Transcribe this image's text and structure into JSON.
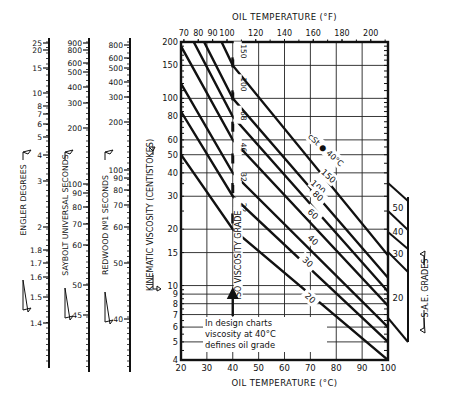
{
  "chart_data": {
    "type": "line",
    "x_bottom": {
      "label": "OIL TEMPERATURE (°C)",
      "ticks": [
        20,
        30,
        40,
        50,
        60,
        70,
        80,
        90,
        100
      ],
      "range": [
        20,
        100
      ]
    },
    "x_top": {
      "label": "OIL TEMPERATURE (°F)",
      "ticks": [
        70,
        80,
        90,
        100,
        120,
        140,
        160,
        180,
        200
      ]
    },
    "y": {
      "label": "KINEMATIC VISCOSITY (CENTISTOKES)",
      "scale": "log",
      "range": [
        4,
        200
      ],
      "ticks": [
        4,
        5,
        6,
        7,
        8,
        9,
        10,
        15,
        20,
        30,
        40,
        50,
        60,
        80,
        100,
        150,
        200
      ]
    },
    "grid": true,
    "series_label": "cSt @ 40°C",
    "series": [
      {
        "name": "150",
        "points": [
          [
            20,
            570
          ],
          [
            40,
            150
          ],
          [
            100,
            14.5
          ]
        ]
      },
      {
        "name": "100",
        "points": [
          [
            20,
            350
          ],
          [
            40,
            100
          ],
          [
            100,
            11.0
          ]
        ]
      },
      {
        "name": "80",
        "points": [
          [
            20,
            270
          ],
          [
            40,
            80
          ],
          [
            100,
            9.3
          ]
        ]
      },
      {
        "name": "60",
        "points": [
          [
            20,
            190
          ],
          [
            40,
            60
          ],
          [
            100,
            7.8
          ]
        ]
      },
      {
        "name": "40",
        "points": [
          [
            20,
            120
          ],
          [
            40,
            40
          ],
          [
            100,
            6.0
          ]
        ]
      },
      {
        "name": "30",
        "points": [
          [
            20,
            85
          ],
          [
            40,
            30
          ],
          [
            100,
            5.0
          ]
        ]
      },
      {
        "name": "20",
        "points": [
          [
            20,
            50
          ],
          [
            40,
            20
          ],
          [
            100,
            4.0
          ]
        ]
      }
    ],
    "iso_vg_grades_at_40C": [
      150,
      100,
      68,
      46,
      32,
      22
    ],
    "iso_vg_label": "ISO VISCOSITY GRADE",
    "annotation": [
      "In design charts",
      "viscosity at 40°C",
      "defines oil grade"
    ],
    "side_scales": [
      {
        "label": "ENGLER DEGREES",
        "ticks": [
          25,
          20,
          15,
          10,
          8,
          7,
          6,
          5,
          4,
          3,
          2,
          1.8,
          1.7,
          1.6,
          1.5,
          1.4
        ]
      },
      {
        "label": "SAYBOLT UNIVERSAL SECONDS",
        "ticks": [
          900,
          800,
          600,
          500,
          400,
          300,
          200,
          100,
          90,
          80,
          70,
          60,
          50,
          45
        ]
      },
      {
        "label": "REDWOOD No1 SECONDS",
        "ticks": [
          800,
          600,
          500,
          400,
          300,
          200,
          100,
          90,
          80,
          70,
          60,
          50,
          40
        ]
      }
    ],
    "sae_grades": {
      "label": "S.A.E. GRADES",
      "grades": [
        "50",
        "40",
        "30",
        "20"
      ]
    }
  }
}
